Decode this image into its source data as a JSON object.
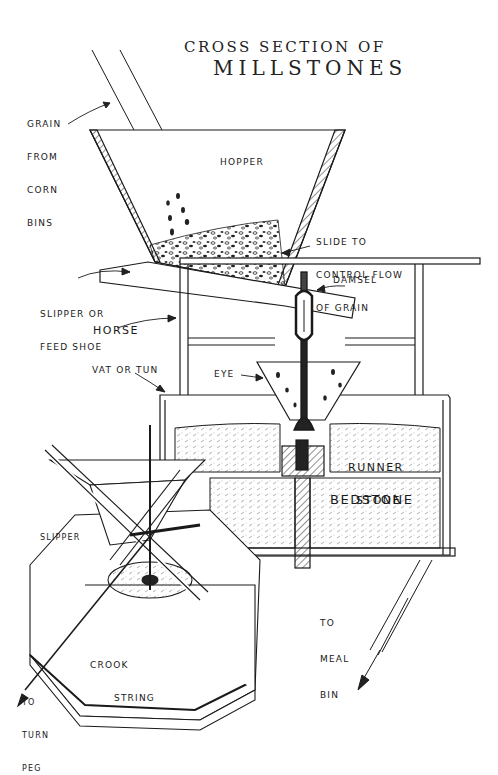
{
  "diagram": {
    "title_line1": "CROSS SECTION OF",
    "title_line2": "MILLSTONES",
    "colors": {
      "ink": "#1a1a1a",
      "paper": "#ffffff",
      "stipple": "#888888"
    },
    "labels": {
      "grain_from_corn_bins": [
        "GRAIN",
        "FROM",
        "CORN",
        "BINS"
      ],
      "hopper": "HOPPER",
      "slide": [
        "SLIDE TO",
        "CONTROL FLOW",
        "OF GRAIN"
      ],
      "damsel": "DAMSEL",
      "slipper_feed_shoe": [
        "SLIPPER OR",
        "FEED SHOE"
      ],
      "horse": "HORSE",
      "vat_or_tun": "VAT OR TUN",
      "eye": "EYE",
      "runner_stone": [
        "RUNNER",
        "STONE"
      ],
      "bedstone": "BEDSTONE",
      "slipper": "SLIPPER",
      "crook_string": [
        "CROOK",
        "STRING"
      ],
      "to_turn_peg": [
        "TO",
        "TURN",
        "PEG"
      ],
      "to_meal_bin": [
        "TO",
        "MEAL",
        "BIN"
      ]
    }
  }
}
